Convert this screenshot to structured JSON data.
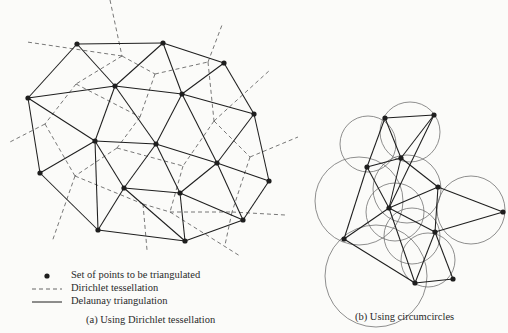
{
  "colors": {
    "ink": "#1e1e1e",
    "dash": "#555555",
    "circle": "#6a6a6a",
    "background": "#fbfbf9"
  },
  "left_diagram": {
    "points": [
      [
        77,
        44
      ],
      [
        163,
        43
      ],
      [
        224,
        63
      ],
      [
        28,
        98
      ],
      [
        115,
        86
      ],
      [
        182,
        94
      ],
      [
        254,
        114
      ],
      [
        95,
        141
      ],
      [
        156,
        144
      ],
      [
        217,
        163
      ],
      [
        40,
        173
      ],
      [
        124,
        188
      ],
      [
        180,
        193
      ],
      [
        269,
        181
      ],
      [
        98,
        230
      ],
      [
        185,
        241
      ],
      [
        243,
        220
      ]
    ],
    "edges": [
      [
        0,
        1
      ],
      [
        1,
        2
      ],
      [
        0,
        3
      ],
      [
        0,
        4
      ],
      [
        1,
        4
      ],
      [
        1,
        5
      ],
      [
        2,
        5
      ],
      [
        2,
        6
      ],
      [
        3,
        4
      ],
      [
        4,
        5
      ],
      [
        5,
        6
      ],
      [
        3,
        7
      ],
      [
        3,
        10
      ],
      [
        4,
        7
      ],
      [
        4,
        8
      ],
      [
        5,
        8
      ],
      [
        5,
        9
      ],
      [
        6,
        9
      ],
      [
        6,
        13
      ],
      [
        7,
        8
      ],
      [
        7,
        10
      ],
      [
        7,
        11
      ],
      [
        7,
        14
      ],
      [
        8,
        11
      ],
      [
        8,
        12
      ],
      [
        8,
        9
      ],
      [
        9,
        12
      ],
      [
        9,
        13
      ],
      [
        9,
        16
      ],
      [
        10,
        14
      ],
      [
        11,
        12
      ],
      [
        11,
        14
      ],
      [
        11,
        15
      ],
      [
        12,
        15
      ],
      [
        12,
        16
      ],
      [
        13,
        16
      ],
      [
        14,
        15
      ],
      [
        15,
        16
      ]
    ],
    "voronoi_segments": [
      [
        [
          110,
          0
        ],
        [
          122,
          56
        ]
      ],
      [
        [
          122,
          56
        ],
        [
          27,
          42
        ]
      ],
      [
        [
          122,
          56
        ],
        [
          155,
          74
        ]
      ],
      [
        [
          122,
          56
        ],
        [
          76,
          84
        ]
      ],
      [
        [
          155,
          74
        ],
        [
          208,
          62
        ]
      ],
      [
        [
          208,
          62
        ],
        [
          222,
          25
        ]
      ],
      [
        [
          208,
          62
        ],
        [
          214,
          121
        ]
      ],
      [
        [
          155,
          74
        ],
        [
          140,
          117
        ]
      ],
      [
        [
          76,
          84
        ],
        [
          45,
          124
        ]
      ],
      [
        [
          45,
          124
        ],
        [
          8,
          143
        ]
      ],
      [
        [
          45,
          124
        ],
        [
          75,
          176
        ]
      ],
      [
        [
          76,
          84
        ],
        [
          140,
          117
        ]
      ],
      [
        [
          140,
          117
        ],
        [
          117,
          148
        ]
      ],
      [
        [
          117,
          148
        ],
        [
          75,
          176
        ]
      ],
      [
        [
          117,
          148
        ],
        [
          183,
          166
        ]
      ],
      [
        [
          214,
          121
        ],
        [
          270,
          70
        ]
      ],
      [
        [
          214,
          121
        ],
        [
          183,
          166
        ]
      ],
      [
        [
          214,
          121
        ],
        [
          250,
          157
        ]
      ],
      [
        [
          250,
          157
        ],
        [
          298,
          137
        ]
      ],
      [
        [
          250,
          157
        ],
        [
          232,
          212
        ]
      ],
      [
        [
          183,
          166
        ],
        [
          170,
          212
        ]
      ],
      [
        [
          75,
          176
        ],
        [
          52,
          242
        ]
      ],
      [
        [
          75,
          176
        ],
        [
          143,
          204
        ]
      ],
      [
        [
          143,
          204
        ],
        [
          170,
          212
        ]
      ],
      [
        [
          170,
          212
        ],
        [
          232,
          212
        ]
      ],
      [
        [
          232,
          212
        ],
        [
          285,
          215
        ]
      ],
      [
        [
          143,
          204
        ],
        [
          147,
          250
        ]
      ],
      [
        [
          170,
          212
        ],
        [
          240,
          256
        ]
      ],
      [
        [
          232,
          212
        ],
        [
          225,
          245
        ]
      ]
    ]
  },
  "right_diagram": {
    "points": [
      [
        385,
        118
      ],
      [
        434,
        115
      ],
      [
        401,
        158
      ],
      [
        367,
        167
      ],
      [
        438,
        187
      ],
      [
        389,
        208
      ],
      [
        503,
        212
      ],
      [
        435,
        232
      ],
      [
        344,
        239
      ],
      [
        415,
        283
      ],
      [
        453,
        279
      ]
    ],
    "edges": [
      [
        0,
        1
      ],
      [
        0,
        2
      ],
      [
        0,
        3
      ],
      [
        1,
        2
      ],
      [
        2,
        3
      ],
      [
        2,
        4
      ],
      [
        2,
        5
      ],
      [
        3,
        5
      ],
      [
        3,
        8
      ],
      [
        4,
        5
      ],
      [
        4,
        6
      ],
      [
        4,
        7
      ],
      [
        5,
        7
      ],
      [
        5,
        8
      ],
      [
        5,
        9
      ],
      [
        6,
        7
      ],
      [
        7,
        9
      ],
      [
        7,
        10
      ],
      [
        8,
        9
      ],
      [
        9,
        10
      ],
      [
        1,
        5
      ]
    ],
    "circles": [
      [
        368,
        144,
        28
      ],
      [
        410,
        132,
        30
      ],
      [
        407,
        189,
        34
      ],
      [
        359,
        201,
        44
      ],
      [
        395,
        212,
        29
      ],
      [
        471,
        210,
        34
      ],
      [
        412,
        236,
        28
      ],
      [
        376,
        276,
        51
      ],
      [
        428,
        260,
        27
      ]
    ]
  },
  "legend": {
    "items": [
      {
        "symbol": "dot",
        "label": "Set of points to be triangulated"
      },
      {
        "symbol": "dashed",
        "label": "Dirichlet tessellation"
      },
      {
        "symbol": "solid",
        "label": "Delaunay triangulation"
      }
    ]
  },
  "captions": {
    "left": "(a)  Using Dirichlet tessellation",
    "right": "(b)  Using circumcircles"
  }
}
